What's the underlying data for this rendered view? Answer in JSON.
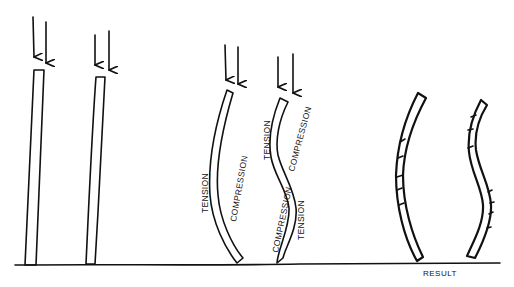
{
  "diagram": {
    "type": "column buckling illustration",
    "columns": [
      {
        "id": 1,
        "state": "straight",
        "load_arrows": 2
      },
      {
        "id": 2,
        "state": "straight",
        "load_arrows": 2
      },
      {
        "id": 3,
        "state": "single-curve buckling",
        "load_arrows": 2,
        "labels": {
          "left": "TENSION",
          "right": "COMPRESSION"
        }
      },
      {
        "id": 4,
        "state": "double-curve (S) buckling",
        "load_arrows": 2,
        "labels": {
          "upper_left": "TENSION",
          "upper_right": "COMPRESSION",
          "lower_left": "COMPRESSION",
          "lower_right": "TENSION"
        }
      },
      {
        "id": 5,
        "state": "failed single curve (cracked compression side)",
        "load_arrows": 0
      },
      {
        "id": 6,
        "state": "failed S-curve (cracked compression sides)",
        "load_arrows": 0
      }
    ],
    "labels": {
      "tension": "TENSION",
      "compression": "COMPRESSION",
      "result": "RESULT"
    },
    "colors": {
      "ink": "#111111",
      "background": "#ffffff"
    }
  }
}
